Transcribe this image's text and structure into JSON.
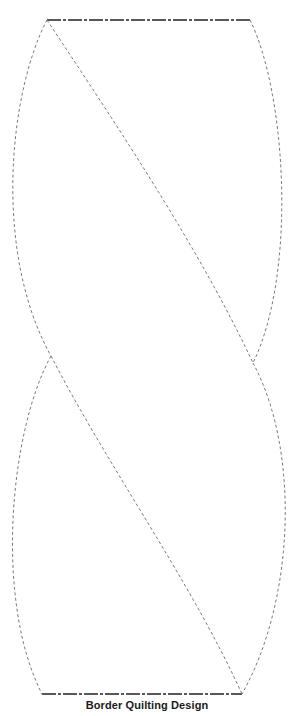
{
  "title": "Border Quilting Design",
  "colors": {
    "background": "#ffffff",
    "stitch_line": "#7a7a7a",
    "edge_line": "#222222",
    "caption": "#1a1a1a"
  },
  "diagram": {
    "type": "quilting-template",
    "top_edge": {
      "x1": 47,
      "x2": 250,
      "y": 20,
      "style": "dash-dot"
    },
    "bottom_edge": {
      "x1": 42,
      "x2": 242,
      "y": 694,
      "style": "dash-dot"
    },
    "crossings": [
      {
        "name": "left-crossing",
        "x": 51,
        "y": 356
      },
      {
        "name": "right-crossing",
        "x": 253,
        "y": 363
      }
    ],
    "stitch_paths": [
      {
        "name": "upper-left-arc",
        "from": [
          47,
          20
        ],
        "to": [
          51,
          356
        ],
        "extreme_x": 4
      },
      {
        "name": "upper-diagonal",
        "from": [
          47,
          20
        ],
        "to": [
          253,
          363
        ]
      },
      {
        "name": "upper-right-arc",
        "from": [
          250,
          20
        ],
        "to": [
          253,
          363
        ],
        "extreme_x": 282
      },
      {
        "name": "lower-left-arc",
        "from": [
          51,
          356
        ],
        "to": [
          42,
          694
        ],
        "extreme_x": 6
      },
      {
        "name": "lower-diagonal",
        "from": [
          51,
          356
        ],
        "to": [
          242,
          694
        ]
      },
      {
        "name": "lower-right-arc",
        "from": [
          253,
          363
        ],
        "to": [
          242,
          694
        ],
        "extreme_x": 284
      }
    ]
  }
}
